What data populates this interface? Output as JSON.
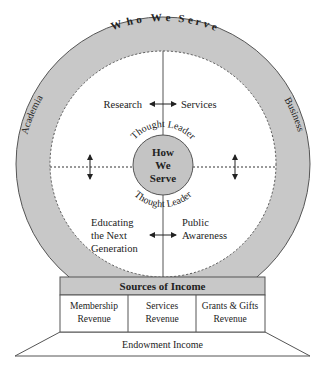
{
  "colors": {
    "ring_fill": "#c8c8c8",
    "center_fill": "#c4c4c4",
    "header_fill": "#c8c8c8",
    "stroke": "#555555",
    "text": "#222222"
  },
  "ring": {
    "title": "Who We Serve",
    "left_label": "Academia",
    "right_label": "Business"
  },
  "quadrants": {
    "top_left": "Research",
    "top_right": "Services",
    "bottom_left_lines": [
      "Educating",
      "the Next",
      "Generation"
    ],
    "bottom_right_lines": [
      "Public",
      "Awareness"
    ]
  },
  "center": {
    "lines": [
      "How",
      "We",
      "Serve"
    ],
    "arc_top": "Thought Leader",
    "arc_bottom": "Thought Leader"
  },
  "income": {
    "header": "Sources of Income",
    "columns": [
      {
        "lines": [
          "Membership",
          "Revenue"
        ]
      },
      {
        "lines": [
          "Services",
          "Revenue"
        ]
      },
      {
        "lines": [
          "Grants & Gifts",
          "Revenue"
        ]
      }
    ],
    "base": "Endowment Income"
  }
}
